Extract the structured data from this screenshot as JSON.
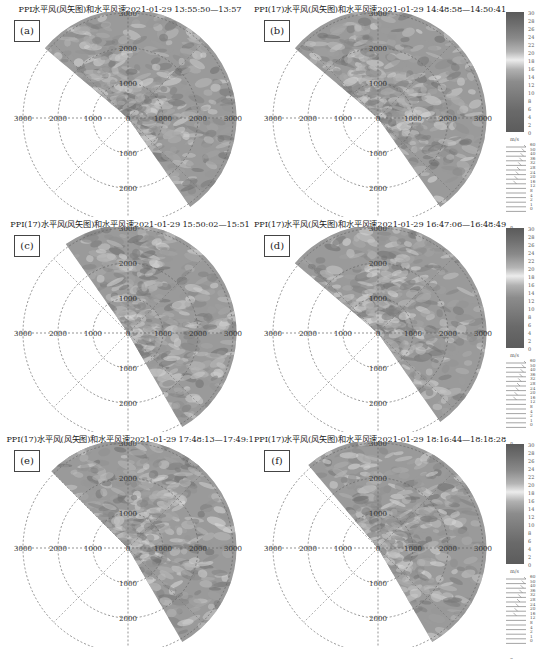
{
  "panels": [
    {
      "id": "a",
      "label": "(a)",
      "title": "PPI水平风(风矢图)和水平风速2021-01-29 13:55:50—13:57",
      "sector_start_deg": -50,
      "sector_end_deg": 145
    },
    {
      "id": "b",
      "label": "(b)",
      "title": "PPI(17)水平风(风矢图)和水平风速2021-01-29 14:48:58—14:50:41",
      "sector_start_deg": -50,
      "sector_end_deg": 145
    },
    {
      "id": "c",
      "label": "(c)",
      "title": "PPI(17)水平风(风矢图)和水平风速2021-01-29 15:50:02—15:51",
      "sector_start_deg": -35,
      "sector_end_deg": 150
    },
    {
      "id": "d",
      "label": "(d)",
      "title": "PPI(17)水平风(风矢图)和水平风速2021-01-29 16:47:06—16:48:49",
      "sector_start_deg": -50,
      "sector_end_deg": 145
    },
    {
      "id": "e",
      "label": "(e)",
      "title": "PPI(17)水平风(风矢图)和水平风速2021-01-29 17:48:13—17:49:1",
      "sector_start_deg": -45,
      "sector_end_deg": 150
    },
    {
      "id": "f",
      "label": "(f)",
      "title": "PPI(17)水平风(风矢图)和水平风速2021-01-29 18:16:44—18:18:28",
      "sector_start_deg": -40,
      "sector_end_deg": 150
    }
  ],
  "axis": {
    "left_labels": [
      "3000",
      "2000",
      "1000"
    ],
    "right_labels": [
      "1000",
      "2000",
      "3000"
    ],
    "up_labels": [
      "1000",
      "2000",
      "3000"
    ],
    "down_labels": [
      "1000",
      "2000"
    ],
    "center_label": "0"
  },
  "colorbar": {
    "ticks": [
      "30",
      "28",
      "26",
      "24",
      "22",
      "20",
      "18",
      "16",
      "14",
      "12",
      "10",
      "8",
      "6",
      "4",
      "2",
      "0"
    ],
    "unit": "m/s"
  },
  "barb_legend": {
    "ticks": [
      "60",
      "50",
      "40",
      "36",
      "32",
      "28",
      "24",
      "20",
      "16",
      "12",
      "8",
      "4",
      "2",
      "1",
      "0"
    ],
    "label": "n"
  },
  "chart_data": {
    "type": "heatmap",
    "subtype": "polar PPI radar scan (horizontal wind speed with wind barbs)",
    "panels": [
      {
        "id": "a",
        "time": "2021-01-29 13:55:50—13:57"
      },
      {
        "id": "b",
        "time": "2021-01-29 14:48:58—14:50:41"
      },
      {
        "id": "c",
        "time": "2021-01-29 15:50:02—15:51"
      },
      {
        "id": "d",
        "time": "2021-01-29 16:47:06—16:48:49"
      },
      {
        "id": "e",
        "time": "2021-01-29 17:48:13—17:49:1"
      },
      {
        "id": "f",
        "time": "2021-01-29 18:16:44—18:18:28"
      }
    ],
    "range_rings_m": [
      1000,
      2000,
      3000
    ],
    "radial_tick_labels": [
      "3000",
      "2000",
      "1000",
      "0",
      "1000",
      "2000",
      "3000"
    ],
    "colorbar": {
      "label": "m/s",
      "range": [
        0,
        30
      ],
      "ticks": [
        0,
        2,
        4,
        6,
        8,
        10,
        12,
        14,
        16,
        18,
        20,
        22,
        24,
        26,
        28,
        30
      ]
    },
    "barb_legend": {
      "label": "m/s",
      "ticks": [
        0,
        1,
        2,
        4,
        8,
        12,
        16,
        20,
        24,
        28,
        32,
        36,
        40,
        50,
        60
      ]
    },
    "grid": true,
    "legend_position": "right"
  }
}
